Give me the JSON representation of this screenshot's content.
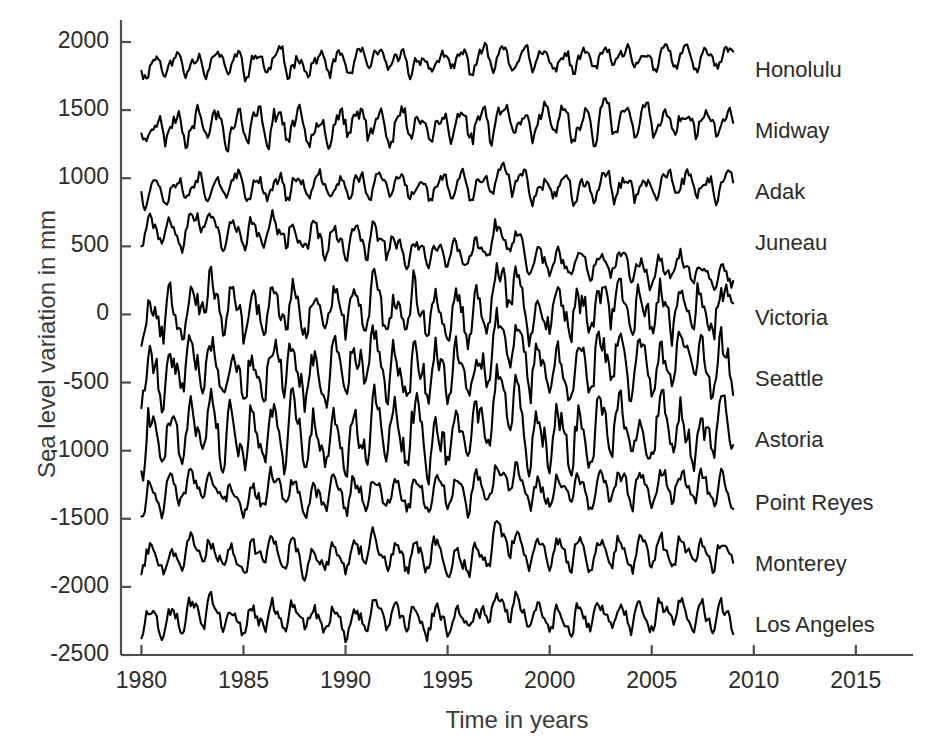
{
  "chart_data": {
    "type": "line",
    "title": "",
    "subtitle": "",
    "xlabel": "Time in years",
    "ylabel": "Sea level variation in mm",
    "xlim": [
      1979.0,
      2017.8
    ],
    "ylim": [
      -2500,
      2000
    ],
    "xticks": [
      1980,
      1985,
      1990,
      1995,
      2000,
      2005,
      2010,
      2015
    ],
    "xtick_labels": [
      "1980",
      "1985",
      "1990",
      "1995",
      "2000",
      "2005",
      "2010",
      "2015"
    ],
    "yticks": [
      2000,
      1500,
      1000,
      500,
      0,
      -500,
      -1000,
      -1500,
      -2000,
      -2500
    ],
    "ytick_labels": [
      "2000",
      "1500",
      "1000",
      "500",
      "0",
      "-500",
      "-1000",
      "-1500",
      "-2000",
      "-2500"
    ],
    "grid": false,
    "legend_position": "right-inline-labels",
    "line_color": "#000000",
    "axis_color": "#4d4d4d",
    "data_start_year": 1980.0,
    "data_end_year": 2009.0,
    "sample_interval_years": 0.0833,
    "note": "Ten vertically offset monthly sea-level records; each trace is plotted about its own baseline offset.",
    "series": [
      {
        "name": "Honolulu",
        "baseline": 1830,
        "label_y_value": 1790,
        "amplitude_mm": 70,
        "trend_mm_per_year": 1.5,
        "seed": 11
      },
      {
        "name": "Midway",
        "baseline": 1380,
        "label_y_value": 1340,
        "amplitude_mm": 95,
        "trend_mm_per_year": 1.0,
        "seed": 23
      },
      {
        "name": "Adak",
        "baseline": 930,
        "label_y_value": 890,
        "amplitude_mm": 75,
        "trend_mm_per_year": 0.5,
        "seed": 37
      },
      {
        "name": "Juneau",
        "baseline": 650,
        "label_y_value": 520,
        "amplitude_mm": 90,
        "trend_mm_per_year": -13.0,
        "seed": 53
      },
      {
        "name": "Victoria",
        "baseline": 0,
        "label_y_value": -30,
        "amplitude_mm": 150,
        "trend_mm_per_year": 0.8,
        "seed": 67
      },
      {
        "name": "Seattle",
        "baseline": -450,
        "label_y_value": -480,
        "amplitude_mm": 160,
        "trend_mm_per_year": 2.0,
        "seed": 79
      },
      {
        "name": "Astoria",
        "baseline": -900,
        "label_y_value": -930,
        "amplitude_mm": 175,
        "trend_mm_per_year": 0.3,
        "seed": 91
      },
      {
        "name": "Point Reyes",
        "baseline": -1350,
        "label_y_value": -1390,
        "amplitude_mm": 95,
        "trend_mm_per_year": 2.0,
        "seed": 103
      },
      {
        "name": "Monterey",
        "baseline": -1800,
        "label_y_value": -1840,
        "amplitude_mm": 85,
        "trend_mm_per_year": 1.4,
        "seed": 117
      },
      {
        "name": "Los Angeles",
        "baseline": -2250,
        "label_y_value": -2290,
        "amplitude_mm": 80,
        "trend_mm_per_year": 0.9,
        "seed": 131
      }
    ]
  }
}
